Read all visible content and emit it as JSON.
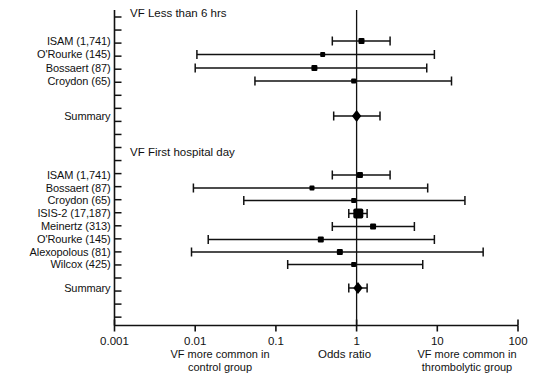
{
  "figure": {
    "kind": "forest-plot",
    "axis_title": "Odds ratio",
    "left_caption_line1": "VF more common in",
    "left_caption_line2": "control group",
    "right_caption_line1": "VF more common in",
    "right_caption_line2": "thrombolytic group",
    "summary_label": "Summary",
    "line_color": "#111111",
    "marker_color": "#000000"
  },
  "chart_data": {
    "type": "scatter",
    "title": "",
    "xlabel": "Odds ratio",
    "ylabel": "",
    "xscale": "log",
    "xlim": [
      0.001,
      100
    ],
    "ticks": [
      {
        "label": "0.001",
        "value": 0.001
      },
      {
        "label": "0.01",
        "value": 0.01
      },
      {
        "label": "0.1",
        "value": 0.1
      },
      {
        "label": "1",
        "value": 1
      },
      {
        "label": "10",
        "value": 10
      },
      {
        "label": "100",
        "value": 100
      }
    ],
    "reference_line": 1,
    "grid": false,
    "legend": "none",
    "annotations": [
      "VF Less than 6 hrs",
      "VF First hospital day",
      "VF more common in control group",
      "VF more common in thrombolytic group"
    ],
    "groups": [
      {
        "name": "VF Less than 6 hrs",
        "rows": [
          {
            "label": "ISAM (1,741)",
            "or": 1.15,
            "lo": 0.5,
            "hi": 2.6,
            "marker": "square",
            "size": 6
          },
          {
            "label": "O'Rourke (145)",
            "or": 0.38,
            "lo": 0.0105,
            "hi": 9.2,
            "marker": "square",
            "size": 5
          },
          {
            "label": "Bossaert (87)",
            "or": 0.3,
            "lo": 0.01,
            "hi": 7.4,
            "marker": "square",
            "size": 6
          },
          {
            "label": "Croydon (65)",
            "or": 0.92,
            "lo": 0.055,
            "hi": 15.0,
            "marker": "square",
            "size": 5
          }
        ],
        "summary": {
          "label": "Summary",
          "or": 1.0,
          "lo": 0.52,
          "hi": 1.95,
          "marker": "diamond",
          "size": 6
        }
      },
      {
        "name": "VF First hospital day",
        "rows": [
          {
            "label": "ISAM (1,741)",
            "or": 1.1,
            "lo": 0.5,
            "hi": 2.6,
            "marker": "square",
            "size": 6
          },
          {
            "label": "Bossaert (87)",
            "or": 0.28,
            "lo": 0.0095,
            "hi": 7.6,
            "marker": "square",
            "size": 5
          },
          {
            "label": "Croydon (65)",
            "or": 0.92,
            "lo": 0.04,
            "hi": 22.0,
            "marker": "square",
            "size": 5
          },
          {
            "label": "ISIS-2 (17,187)",
            "or": 1.05,
            "lo": 0.8,
            "hi": 1.35,
            "marker": "square",
            "size": 10
          },
          {
            "label": "Meinertz (313)",
            "or": 1.6,
            "lo": 0.5,
            "hi": 5.2,
            "marker": "square",
            "size": 6
          },
          {
            "label": "O'Rourke (145)",
            "or": 0.36,
            "lo": 0.0145,
            "hi": 9.2,
            "marker": "square",
            "size": 6
          },
          {
            "label": "Alexopolous (81)",
            "or": 0.62,
            "lo": 0.009,
            "hi": 37.0,
            "marker": "square",
            "size": 6
          },
          {
            "label": "Wilcox (425)",
            "or": 0.92,
            "lo": 0.14,
            "hi": 6.6,
            "marker": "square",
            "size": 5
          }
        ],
        "summary": {
          "label": "Summary",
          "or": 1.04,
          "lo": 0.8,
          "hi": 1.35,
          "marker": "diamond",
          "size": 6
        }
      }
    ]
  }
}
